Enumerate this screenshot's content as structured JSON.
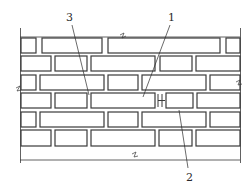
{
  "diagram": {
    "type": "brick-wall-elevation",
    "colors": {
      "line": "#3a3a3a",
      "background": "#ffffff",
      "brick_fill": "#ffffff"
    },
    "wall": {
      "left": 20,
      "right": 240,
      "top": 37,
      "bottom": 160
    },
    "courses": [
      {
        "y": 37,
        "h": 18
      },
      {
        "y": 55,
        "h": 18
      },
      {
        "y": 73,
        "h": 19
      },
      {
        "y": 92,
        "h": 18
      },
      {
        "y": 110,
        "h": 19
      },
      {
        "y": 129,
        "h": 19
      }
    ],
    "callouts": [
      {
        "id": "3",
        "text": "3",
        "x": 66,
        "y": 12
      },
      {
        "id": "1",
        "text": "1",
        "x": 168,
        "y": 12
      },
      {
        "id": "2",
        "text": "2",
        "x": 186,
        "y": 172
      }
    ]
  }
}
